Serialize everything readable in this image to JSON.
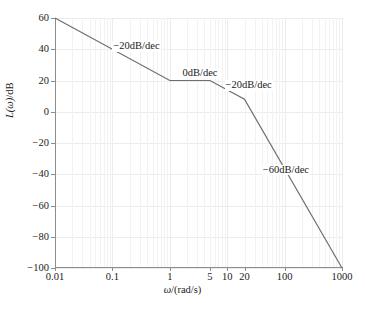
{
  "chart_data": {
    "type": "line",
    "title": "",
    "xlabel": "ω/(rad/s)",
    "ylabel": "L(ω)/dB",
    "xscale": "log",
    "xlim": [
      0.01,
      1000
    ],
    "ylim": [
      -100,
      60
    ],
    "grid": true,
    "legend": null,
    "xticks": [
      {
        "value": 0.01,
        "label": "0.01"
      },
      {
        "value": 0.1,
        "label": "0.1"
      },
      {
        "value": 1,
        "label": "1"
      },
      {
        "value": 5,
        "label": "5"
      },
      {
        "value": 10,
        "label": "10"
      },
      {
        "value": 20,
        "label": "20"
      },
      {
        "value": 100,
        "label": "100"
      },
      {
        "value": 1000,
        "label": "1000"
      }
    ],
    "yticks": [
      {
        "value": 60,
        "label": "60"
      },
      {
        "value": 40,
        "label": "40"
      },
      {
        "value": 20,
        "label": "20"
      },
      {
        "value": 0,
        "label": "0"
      },
      {
        "value": -20,
        "label": "−20"
      },
      {
        "value": -40,
        "label": "−40"
      },
      {
        "value": -60,
        "label": "−60"
      },
      {
        "value": -80,
        "label": "−80"
      },
      {
        "value": -100,
        "label": "−100"
      }
    ],
    "series": [
      {
        "name": "asymptotic-magnitude",
        "color": "#6e6e6e",
        "points": [
          {
            "x": 0.01,
            "y": 60
          },
          {
            "x": 1,
            "y": 20
          },
          {
            "x": 5,
            "y": 20
          },
          {
            "x": 20,
            "y": 8
          },
          {
            "x": 1000,
            "y": -100
          }
        ]
      }
    ],
    "annotations": [
      {
        "text": "−20dB/dec",
        "x": 0.1,
        "y": 42,
        "name": "slope-label-segment-1"
      },
      {
        "text": "0dB/dec",
        "x": 1.6,
        "y": 25,
        "name": "slope-label-segment-2"
      },
      {
        "text": "−20dB/dec",
        "x": 9,
        "y": 17,
        "name": "slope-label-segment-3"
      },
      {
        "text": "−60dB/dec",
        "x": 40,
        "y": -37,
        "name": "slope-label-segment-4"
      }
    ]
  }
}
